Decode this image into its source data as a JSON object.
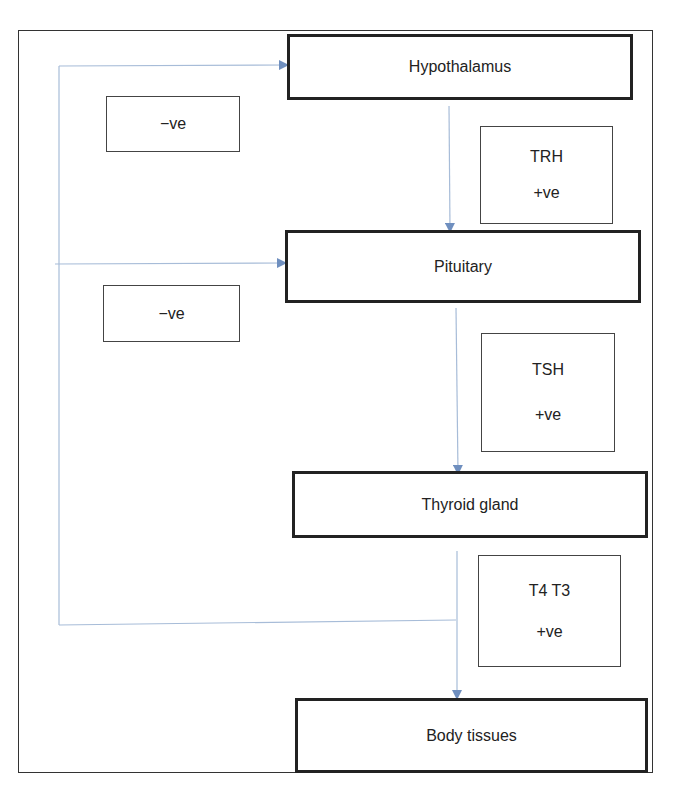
{
  "diagram": {
    "nodes": {
      "hypothalamus": {
        "label": "Hypothalamus"
      },
      "pituitary": {
        "label": "Pituitary"
      },
      "thyroid": {
        "label": "Thyroid gland"
      },
      "body_tissues": {
        "label": "Body tissues"
      }
    },
    "annotations": {
      "neg1": {
        "label": "−ve"
      },
      "neg2": {
        "label": "−ve"
      },
      "trh": {
        "hormone": "TRH",
        "effect": "+ve"
      },
      "tsh": {
        "hormone": "TSH",
        "effect": "+ve"
      },
      "t4t3": {
        "hormone": "T4 T3",
        "effect": "+ve"
      }
    },
    "edges": [
      {
        "from": "Hypothalamus",
        "to": "Pituitary",
        "label": "TRH +ve"
      },
      {
        "from": "Pituitary",
        "to": "Thyroid gland",
        "label": "TSH +ve"
      },
      {
        "from": "Thyroid gland",
        "to": "Body tissues",
        "label": "T4 T3 +ve"
      },
      {
        "from": "T4 T3",
        "to": "Hypothalamus",
        "label": "−ve"
      },
      {
        "from": "T4 T3",
        "to": "Pituitary",
        "label": "−ve"
      }
    ],
    "colors": {
      "arrow": "#6f8fbf",
      "line": "#9fb6d6",
      "border": "#222222"
    }
  }
}
